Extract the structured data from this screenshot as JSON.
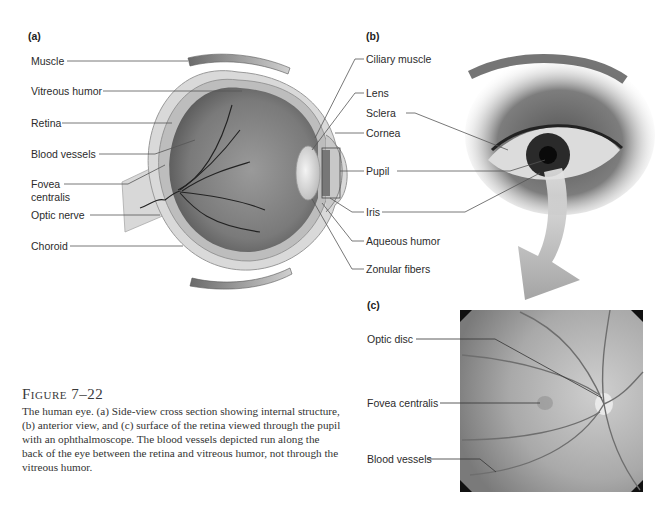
{
  "figure": {
    "number_label": "Figure 7–22",
    "caption": "The human eye. (a) Side-view cross section showing internal structure, (b) anterior view, and (c) surface of the retina viewed through the pupil with an ophthalmoscope. The blood vessels depicted run along the back of the eye between the retina and vitreous humor, not through the vitreous humor."
  },
  "panel_a": {
    "tag": "(a)",
    "left_labels": [
      "Muscle",
      "Vitreous humor",
      "Retina",
      "Blood vessels",
      "Fovea",
      "centralis",
      "Optic nerve",
      "Choroid"
    ],
    "right_labels": [
      "Ciliary muscle",
      "Lens",
      "Cornea",
      "Pupil",
      "Iris",
      "Aqueous humor",
      "Zonular fibers"
    ]
  },
  "panel_b": {
    "tag": "(b)",
    "labels": [
      "Sclera"
    ]
  },
  "panel_c": {
    "tag": "(c)",
    "labels": [
      "Optic disc",
      "Fovea centralis",
      "Blood vessels"
    ]
  },
  "colors": {
    "background": "#ffffff",
    "leader_line": "#555555",
    "text": "#2b2b2b"
  }
}
